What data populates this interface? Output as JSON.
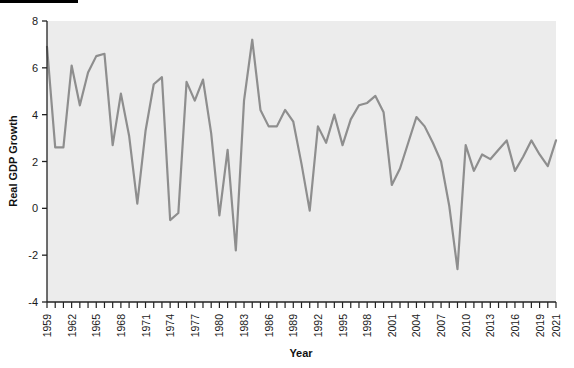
{
  "chart_data": {
    "type": "line",
    "title": "",
    "xlabel": "Year",
    "ylabel": "Real GDP Growth",
    "xlim": [
      1959,
      2021
    ],
    "ylim": [
      -4,
      8
    ],
    "y_ticks": [
      8,
      6,
      4,
      2,
      0,
      -2,
      -4
    ],
    "x_tick_labels": [
      "1959",
      "1962",
      "1965",
      "1968",
      "1971",
      "1974",
      "1977",
      "1980",
      "1983",
      "1986",
      "1989",
      "1992",
      "1995",
      "1998",
      "2001",
      "2004",
      "2007",
      "2010",
      "2013",
      "2016",
      "2019",
      "2021"
    ],
    "x_label_step": 3,
    "minor_ticks_every_year": true,
    "grid": false,
    "legend": "none",
    "series": [
      {
        "name": "Real GDP Growth",
        "color": "#8e8e8e",
        "x": [
          1959,
          1960,
          1961,
          1962,
          1963,
          1964,
          1965,
          1966,
          1967,
          1968,
          1969,
          1970,
          1971,
          1972,
          1973,
          1974,
          1975,
          1976,
          1977,
          1978,
          1979,
          1980,
          1981,
          1982,
          1983,
          1984,
          1985,
          1986,
          1987,
          1988,
          1989,
          1990,
          1991,
          1992,
          1993,
          1994,
          1995,
          1996,
          1997,
          1998,
          1999,
          2000,
          2001,
          2002,
          2003,
          2004,
          2005,
          2006,
          2007,
          2008,
          2009,
          2010,
          2011,
          2012,
          2013,
          2014,
          2015,
          2016,
          2017,
          2018,
          2019,
          2020,
          2021
        ],
        "values": [
          6.9,
          2.6,
          2.6,
          6.1,
          4.4,
          5.8,
          6.5,
          6.6,
          2.7,
          4.9,
          3.1,
          0.2,
          3.3,
          5.3,
          5.6,
          -0.5,
          -0.2,
          5.4,
          4.6,
          5.5,
          3.2,
          -0.3,
          2.5,
          -1.8,
          4.6,
          7.2,
          4.2,
          3.5,
          3.5,
          4.2,
          3.7,
          1.9,
          -0.1,
          3.5,
          2.8,
          4.0,
          2.7,
          3.8,
          4.4,
          4.5,
          4.8,
          4.1,
          1.0,
          1.7,
          2.8,
          3.9,
          3.5,
          2.8,
          2.0,
          0.1,
          -2.6,
          2.7,
          1.6,
          2.3,
          2.1,
          2.5,
          2.9,
          1.6,
          2.2,
          2.9,
          2.3,
          1.8,
          2.9
        ]
      }
    ]
  },
  "axes": {
    "y_label": "Real GDP Growth",
    "x_label": "Year"
  },
  "style": {
    "line_color": "#8e8e8e",
    "plot_background": "#ececec",
    "axis_color": "#222222",
    "page_background": "#ffffff",
    "rule_color": "#000000"
  }
}
